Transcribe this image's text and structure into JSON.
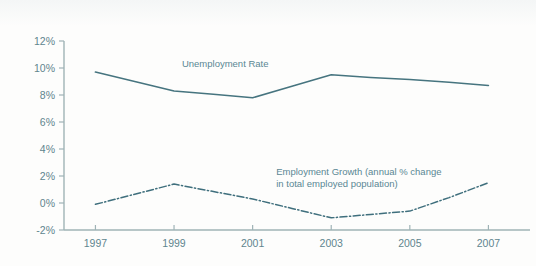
{
  "figure": {
    "background_color": "#fdfdfc",
    "accent_color": "#46747f",
    "label_color": "#5f858e",
    "axis_color": "#9fb3b6"
  },
  "decor": {
    "top_rule_name": "top-page-rule",
    "top_tick_name": "top-margin-tick"
  },
  "chart_data": {
    "type": "line",
    "title": "",
    "xlabel": "",
    "ylabel": "",
    "x": [
      1997,
      1998,
      1999,
      2000,
      2001,
      2002,
      2003,
      2004,
      2005,
      2006,
      2007
    ],
    "categories": [
      "1997",
      "1998",
      "1999",
      "2000",
      "2001",
      "2002",
      "2003",
      "2004",
      "2005",
      "2006",
      "2007"
    ],
    "xtick_labels": [
      "1997",
      "1999",
      "2001",
      "2003",
      "2005",
      "2007"
    ],
    "xtick_values": [
      1997,
      1999,
      2001,
      2003,
      2005,
      2007
    ],
    "ytick_labels": [
      "12%",
      "10%",
      "8%",
      "6%",
      "4%",
      "2%",
      "0%",
      "-2%"
    ],
    "ytick_values": [
      12,
      10,
      8,
      6,
      4,
      2,
      0,
      -2
    ],
    "xlim": [
      1996.2,
      2007.6
    ],
    "ylim": [
      -2,
      12
    ],
    "grid": false,
    "legend_position": "inline-annotation",
    "series": [
      {
        "name": "Unemployment Rate",
        "style": "solid",
        "color": "#46747f",
        "label": "Unemployment Rate",
        "label_x": 1999.2,
        "label_y": 10.05,
        "values": [
          9.7,
          9.0,
          8.3,
          8.05,
          7.8,
          8.65,
          9.5,
          9.3,
          9.15,
          8.95,
          8.7
        ]
      },
      {
        "name": "Employment Growth (annual % change in total employed population)",
        "style": "dash-dot",
        "color": "#3f6f7d",
        "label_line1": "Employment Growth (annual % change",
        "label_line2": "in total employed population)",
        "label_x": 2001.6,
        "label_y": 2.1,
        "values": [
          -0.1,
          0.65,
          1.4,
          0.85,
          0.3,
          -0.4,
          -1.1,
          -0.85,
          -0.6,
          0.4,
          1.5
        ]
      }
    ],
    "annotations": [
      {
        "text": "Unemployment Rate"
      },
      {
        "text": "Employment Growth (annual % change"
      },
      {
        "text": "in total employed population)"
      }
    ]
  }
}
